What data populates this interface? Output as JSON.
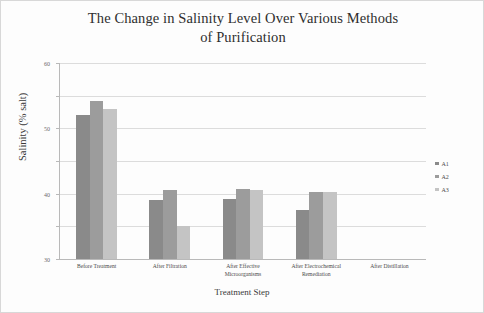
{
  "chart_data": {
    "type": "bar",
    "title": "The Change in Salinity Level Over Various Methods of Purification",
    "title_line1": "The Change in Salinity Level Over Various Methods",
    "title_line2": "of Purification",
    "xlabel": "Treatment Step",
    "ylabel": "Salinity (% salt)",
    "ylim": [
      0,
      60
    ],
    "yticks": [
      0,
      10,
      20,
      30,
      40,
      50,
      60
    ],
    "ytick_labels": [
      "0",
      "10",
      "20",
      "30",
      "40",
      "50",
      "60"
    ],
    "grid": true,
    "legend_position": "right",
    "categories": [
      "Before Treatment",
      "After Filtration",
      "After Effective\nMicroorganisms",
      "After Electrochemical\nRemediation",
      "After Distillation"
    ],
    "series": [
      {
        "name": "A1",
        "color": "#8a8a8a",
        "values": [
          44,
          18,
          18.5,
          15,
          0
        ]
      },
      {
        "name": "A2",
        "color": "#9c9c9c",
        "values": [
          48.5,
          21,
          21.5,
          20.5,
          0
        ]
      },
      {
        "name": "A3",
        "color": "#c4c4c4",
        "values": [
          46,
          10,
          21,
          20.5,
          0
        ]
      }
    ]
  },
  "legend": {
    "items": [
      {
        "label": "A1",
        "color": "#8a8a8a"
      },
      {
        "label": "A2",
        "color": "#9c9c9c"
      },
      {
        "label": "A3",
        "color": "#c4c4c4"
      }
    ]
  }
}
